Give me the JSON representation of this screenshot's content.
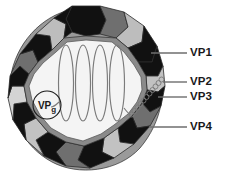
{
  "figure": {
    "name": "picornavirus-virion-diagram",
    "background_color": "#ffffff"
  },
  "capsid": {
    "center_x": 86,
    "center_y": 88,
    "outer_radius": 80,
    "inner_radius": 57,
    "segment_count": 15,
    "colors": {
      "black": "#111111",
      "dark_gray": "#666666",
      "mid_gray": "#8a8a8a",
      "light_gray": "#bdbdbd",
      "pale_gray": "#d4d4d4",
      "cavity": "#f2f2f2",
      "outline": "#2b2b2b"
    },
    "segment_shades": [
      "black",
      "dark_gray",
      "light_gray",
      "black",
      "mid_gray",
      "pale_gray",
      "black",
      "dark_gray",
      "light_gray",
      "black",
      "mid_gray",
      "pale_gray",
      "black",
      "dark_gray",
      "light_gray"
    ]
  },
  "genome": {
    "name": "rna-genome",
    "loop_count": 4,
    "loop_color": "#7b7b7b",
    "polya": {
      "name": "poly-a-bead-chain",
      "bead_count": 11,
      "color": "#7b7b7b"
    }
  },
  "vpg": {
    "label": "VP",
    "subscript": "g",
    "circle_cx": 47,
    "circle_cy": 105,
    "circle_r": 14,
    "color": "#1a1a1a"
  },
  "labels": [
    {
      "id": "vp1",
      "text": "VP1",
      "leader": {
        "x1": 151,
        "y1": 53,
        "x2": 187,
        "y2": 53
      }
    },
    {
      "id": "vp2",
      "text": "VP2",
      "leader": {
        "x1": 163,
        "y1": 82,
        "x2": 187,
        "y2": 82
      }
    },
    {
      "id": "vp3",
      "text": "VP3",
      "leader": {
        "x1": 158,
        "y1": 97,
        "x2": 187,
        "y2": 97
      }
    },
    {
      "id": "vp4",
      "text": "VP4",
      "leader": {
        "x1": 149,
        "y1": 127,
        "x2": 187,
        "y2": 127
      }
    }
  ],
  "leader_color": "#6e6e6e"
}
